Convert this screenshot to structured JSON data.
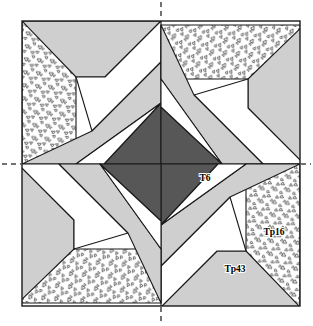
{
  "figure": {
    "kind": "tiling-diagram",
    "title_visible": false,
    "background": "#ffffff",
    "frame": {
      "x": 22,
      "y": 21,
      "width": 278,
      "height": 285,
      "stroke": "#1a1a1a",
      "stroke_width": 1.4,
      "fill": "#ffffff"
    },
    "center": {
      "x": 161,
      "y": 164
    },
    "symmetry": "4-fold rotational (90 degrees) about center",
    "palette": {
      "dark_gray": "#575757",
      "light_gray": "#cfcfcf",
      "white": "#ffffff",
      "stipple_background": "#ffffff",
      "stipple_mark": "#4a4a4a",
      "outline": "#1a1a1a",
      "label_text": "#000000",
      "axis_dash": "#444444"
    },
    "labels": [
      {
        "id": "label-t6",
        "text": "T6",
        "x": 205,
        "y": 181
      },
      {
        "id": "label-tp16",
        "text": "Tp16",
        "x": 274,
        "y": 235
      },
      {
        "id": "label-tp43",
        "text": "Tp43",
        "x": 235,
        "y": 272
      }
    ],
    "axes": [
      {
        "id": "axis-vertical-top",
        "orientation": "vertical",
        "x1": 161,
        "y1": 2,
        "x2": 161,
        "y2": 20
      },
      {
        "id": "axis-vertical-bottom",
        "orientation": "vertical",
        "x1": 161,
        "y1": 307,
        "x2": 161,
        "y2": 324
      },
      {
        "id": "axis-horizontal-left",
        "orientation": "horizontal",
        "x1": 2,
        "y1": 164,
        "x2": 21,
        "y2": 164
      },
      {
        "id": "axis-horizontal-right",
        "orientation": "horizontal",
        "x1": 301,
        "y1": 164,
        "x2": 311,
        "y2": 164
      }
    ],
    "quadrant_pieces": [
      {
        "id": "piece-stipple-band",
        "fill": "stipple",
        "points": "22,21 76,21 76,164 22,164"
      },
      {
        "id": "piece-light-wedge",
        "fill": "light_gray",
        "points": "22,21 161,21 105,77 76,77"
      },
      {
        "id": "piece-white-bar",
        "fill": "white",
        "points": "76,77 105,77 161,21 161,62 92,131"
      },
      {
        "id": "piece-light-blade",
        "fill": "light_gray",
        "points": "22,164 92,131 161,62 161,103 76,164"
      },
      {
        "id": "piece-dark-blade",
        "fill": "dark_gray",
        "points": "161,103 161,164 104,164"
      },
      {
        "id": "piece-white-notch",
        "fill": "white",
        "points": "76,164 161,103 104,164"
      }
    ]
  }
}
